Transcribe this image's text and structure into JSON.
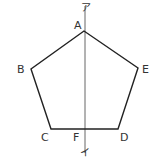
{
  "figure": {
    "shape": "regular-pentagon",
    "vertices": [
      {
        "name": "A",
        "x": 84,
        "y": 31,
        "label_x": 74,
        "label_y": 29
      },
      {
        "name": "B",
        "x": 31,
        "y": 69,
        "label_x": 17,
        "label_y": 73
      },
      {
        "name": "C",
        "x": 51,
        "y": 129,
        "label_x": 41,
        "label_y": 141
      },
      {
        "name": "D",
        "x": 118,
        "y": 129,
        "label_x": 120,
        "label_y": 141
      },
      {
        "name": "E",
        "x": 138,
        "y": 68,
        "label_x": 142,
        "label_y": 73
      }
    ],
    "axis_line": {
      "x1": 85,
      "y1": 6,
      "x2": 85,
      "y2": 153,
      "top_label": "ア",
      "bottom_label": "イ"
    },
    "intersection_point": {
      "name": "F",
      "label_x": 73,
      "label_y": 141
    },
    "colors": {
      "polygon_stroke": "#222222",
      "axis_stroke": "#666666",
      "text": "#333333"
    }
  }
}
